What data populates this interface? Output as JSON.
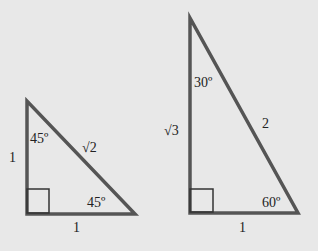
{
  "triangles": [
    {
      "name": "45-45-90",
      "vertical_side": "1",
      "bottom_side": "1",
      "hypotenuse": "√2",
      "top_angle": "45º",
      "right_angle_label": "45º"
    },
    {
      "name": "30-60-90",
      "vertical_side": "√3",
      "bottom_side": "1",
      "hypotenuse": "2",
      "top_angle": "30º",
      "right_angle_label": "60º"
    }
  ],
  "colors": {
    "background": "#e8e8e8",
    "stroke": "#555555"
  }
}
